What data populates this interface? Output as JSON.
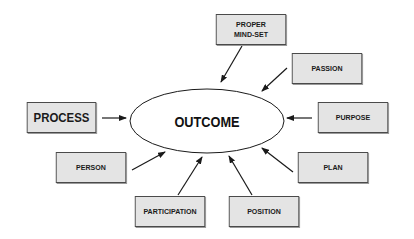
{
  "diagram": {
    "center": {
      "label": "OUTCOME"
    },
    "nodes": [
      {
        "id": "proper-mind-set",
        "line1": "PROPER",
        "line2": "MIND-SET"
      },
      {
        "id": "passion",
        "label": "PASSION"
      },
      {
        "id": "process",
        "label": "PROCESS"
      },
      {
        "id": "purpose",
        "label": "PURPOSE"
      },
      {
        "id": "person",
        "label": "PERSON"
      },
      {
        "id": "plan",
        "label": "PLAN"
      },
      {
        "id": "participation",
        "label": "PARTICIPATION"
      },
      {
        "id": "position",
        "label": "POSITION"
      }
    ],
    "edges": [
      {
        "from": "proper-mind-set",
        "to": "outcome"
      },
      {
        "from": "passion",
        "to": "outcome"
      },
      {
        "from": "process",
        "to": "outcome"
      },
      {
        "from": "purpose",
        "to": "outcome"
      },
      {
        "from": "person",
        "to": "outcome"
      },
      {
        "from": "plan",
        "to": "outcome"
      },
      {
        "from": "participation",
        "to": "outcome"
      },
      {
        "from": "position",
        "to": "outcome"
      }
    ],
    "colors": {
      "box_fill": "#e4e4e4",
      "box_border": "#4a4a4a",
      "line": "#1a1a1a",
      "background": "#ffffff"
    }
  }
}
